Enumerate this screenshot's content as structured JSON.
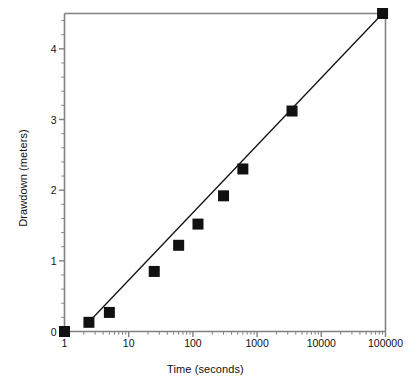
{
  "chart_data": {
    "type": "scatter",
    "title": "",
    "xlabel": "Time (seconds)",
    "ylabel": "Drawdown (meters)",
    "xscale": "log",
    "yscale": "linear",
    "xlim": [
      1,
      100000
    ],
    "ylim": [
      0,
      4.5
    ],
    "grid": false,
    "legend": null,
    "x_tick_labels": [
      "1",
      "10",
      "100",
      "1000",
      "10000",
      "100000"
    ],
    "x_tick_values": [
      1,
      10,
      100,
      1000,
      10000,
      100000
    ],
    "y_tick_labels": [
      "0",
      "1",
      "2",
      "3",
      "4"
    ],
    "y_tick_values": [
      0,
      1,
      2,
      3,
      4
    ],
    "y_minor_tick_interval": 0.2,
    "marker": "filled-square",
    "marker_color": "#111111",
    "line_color": "#111111",
    "axis_color": "#808080",
    "series": [
      {
        "name": "Drawdown data",
        "points": [
          {
            "x": 1,
            "y": 0.0
          },
          {
            "x": 2.4,
            "y": 0.13
          },
          {
            "x": 5,
            "y": 0.27
          },
          {
            "x": 25,
            "y": 0.85
          },
          {
            "x": 60,
            "y": 1.22
          },
          {
            "x": 120,
            "y": 1.52
          },
          {
            "x": 300,
            "y": 1.92
          },
          {
            "x": 600,
            "y": 2.3
          },
          {
            "x": 3500,
            "y": 3.12
          },
          {
            "x": 90000,
            "y": 4.5
          }
        ]
      },
      {
        "name": "Fitted straight line",
        "type": "line",
        "points": [
          {
            "x": 2.2,
            "y": 0.1
          },
          {
            "x": 90000,
            "y": 4.5
          }
        ]
      }
    ]
  }
}
